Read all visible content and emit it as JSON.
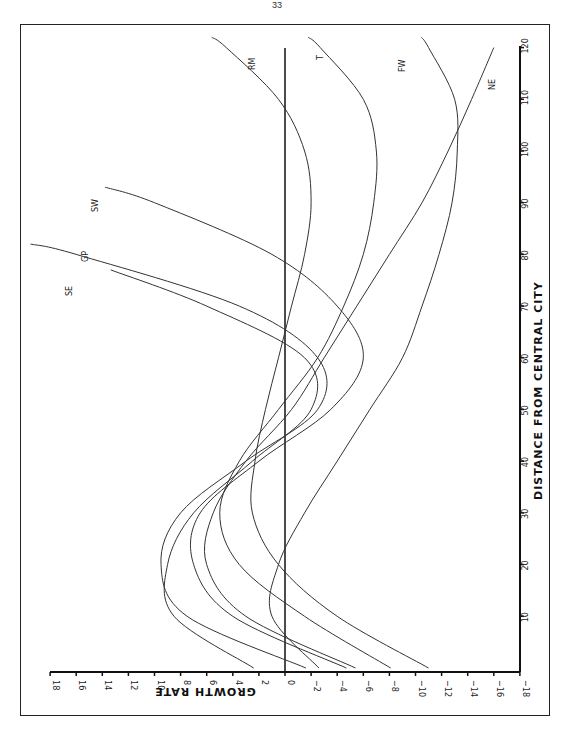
{
  "page": {
    "number": "33"
  },
  "chart_data": {
    "type": "line",
    "orientation": "rotated 90° counter-clockwise (distance axis vertical on right, growth-rate axis horizontal at bottom)",
    "title": "",
    "xlabel": "DISTANCE FROM CENTRAL CITY",
    "ylabel": "GROWTH RATE",
    "xlim": [
      0,
      120
    ],
    "ylim": [
      -18,
      18
    ],
    "x_ticks": [
      10,
      20,
      30,
      40,
      50,
      60,
      70,
      80,
      90,
      100,
      110,
      120
    ],
    "y_ticks": [
      18,
      16,
      14,
      12,
      10,
      8,
      6,
      4,
      2,
      0,
      -2,
      -4,
      -6,
      -8,
      -10,
      -12,
      -14,
      -16,
      -18
    ],
    "y_tick_labels": [
      "18",
      "16",
      "14",
      "12",
      "10",
      "8",
      "6",
      "4",
      "2",
      "0",
      "−2",
      "−4",
      "−6",
      "−8",
      "−10",
      "−12",
      "−14",
      "−16",
      "−18"
    ],
    "reference_line": {
      "y": 0
    },
    "grid": false,
    "legend": "inline labels at curve ends",
    "x": [
      0,
      10,
      20,
      30,
      40,
      50,
      60,
      70,
      80,
      90,
      100,
      110,
      120
    ],
    "series": [
      {
        "name": "SE",
        "values": [
          2.4,
          8.5,
          9.0,
          7.0,
          2.5,
          -2.0,
          -1.5,
          6.0,
          null,
          null,
          null,
          null,
          null
        ],
        "end_x": 77
      },
      {
        "name": "GP",
        "values": [
          -1.6,
          7.5,
          9.5,
          8.0,
          3.0,
          -2.5,
          -2.5,
          3.5,
          16.0,
          null,
          null,
          null,
          null
        ],
        "end_x": 82
      },
      {
        "name": "SW",
        "values": [
          -4.7,
          4.0,
          7.0,
          6.5,
          2.0,
          -3.5,
          -6.0,
          -4.0,
          1.0,
          10.0,
          null,
          null,
          null
        ],
        "end_x": 93
      },
      {
        "name": "RM",
        "values": [
          -11.0,
          -4.0,
          0.5,
          2.5,
          2.3,
          1.5,
          0.5,
          -0.5,
          -1.5,
          -2.0,
          -1.5,
          0.5,
          4.5
        ],
        "end_x": 122
      },
      {
        "name": "T",
        "values": [
          -8.1,
          -1.5,
          3.5,
          5.0,
          3.5,
          0.5,
          -2.5,
          -4.5,
          -6.0,
          -6.8,
          -7.0,
          -6.0,
          -2.7
        ],
        "end_x": 122
      },
      {
        "name": "FW",
        "values": [
          -2.6,
          1.0,
          0.5,
          -1.5,
          -4.0,
          -6.5,
          -9.0,
          -10.5,
          -11.8,
          -12.8,
          -13.2,
          -13.0,
          -11.0
        ],
        "end_x": 122
      },
      {
        "name": "NE",
        "values": [
          -5.4,
          3.0,
          6.0,
          5.5,
          3.0,
          -0.5,
          -3.0,
          -5.5,
          -8.0,
          -10.5,
          -12.5,
          -14.3,
          -16.0
        ],
        "end_x": 120
      }
    ]
  },
  "labels": {
    "SE": "SE",
    "GP": "GP",
    "SW": "SW",
    "RM": "RM",
    "T": "T",
    "FW": "FW",
    "NE": "NE"
  }
}
